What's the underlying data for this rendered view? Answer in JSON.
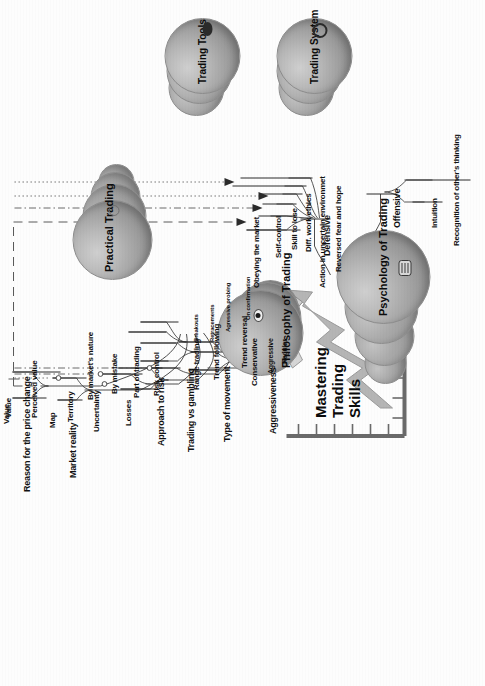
{
  "diagram": {
    "title": "Mastering Trading Skills",
    "title_lines": [
      "Mastering",
      "Trading",
      "Skills"
    ],
    "type": "mind-map",
    "orientation": "rotated-90-ccw",
    "colors": {
      "bubble_fill": "#a8a8a8",
      "bubble_shadow": "#7e7e7e",
      "line": "#2b2b2b",
      "text": "#111111",
      "background": "#ffffff",
      "arrow_fill": "#c9c9c9",
      "chart_axis": "#6f6f6f"
    }
  },
  "central_nodes": [
    {
      "id": "philosophy",
      "label": "Philosophy of Trading",
      "icon": "eye-icon"
    },
    {
      "id": "practical",
      "label": "Practical Trading",
      "icon": "disc-stack-icon"
    },
    {
      "id": "psychology",
      "label": "Psychology of Trading",
      "icon": "brain-icon"
    },
    {
      "id": "tools",
      "label": "Trading Tools",
      "icon": "wrench-icon"
    },
    {
      "id": "system",
      "label": "Trading System",
      "icon": "gear-icon"
    }
  ],
  "branches": {
    "philosophy": [
      {
        "label": "Reason for the price change",
        "children": [
          {
            "label": "Value"
          },
          {
            "label": "Perceived value"
          }
        ]
      },
      {
        "label": "Market reality",
        "children": [
          {
            "label": "Map"
          },
          {
            "label": "Territory",
            "marker": "circle"
          }
        ]
      },
      {
        "label": "Uncertainty",
        "marker": "circle",
        "children": [
          {
            "label": "By market's nature",
            "marker": "circle"
          }
        ]
      },
      {
        "label": "Losses",
        "children": [
          {
            "label": "By mistake"
          },
          {
            "label": "Part of trading"
          }
        ]
      },
      {
        "label": "Approach to risk",
        "children": [
          {
            "label": "Risk control",
            "marker": "circle"
          }
        ]
      },
      {
        "label": "Trading vs gambling",
        "children": []
      },
      {
        "label": "Type of movement",
        "children": [
          {
            "label": "Range trading"
          },
          {
            "label": "Trend following",
            "children": [
              {
                "label": "Breakouts"
              },
              {
                "label": "Retracements"
              }
            ]
          },
          {
            "label": "Trend reversal",
            "children": [
              {
                "label": "Agressive probing"
              },
              {
                "label": "On confirmation"
              }
            ]
          }
        ]
      },
      {
        "label": "Aggressiveness",
        "children": [
          {
            "label": "Conservative"
          },
          {
            "label": "Aggressive"
          },
          {
            "label": "Regular"
          }
        ]
      }
    ],
    "psychology": [
      {
        "label": "Defensive",
        "children": [
          {
            "label": "Obeying the market"
          },
          {
            "label": "Self-control"
          },
          {
            "label": "Skill to lose"
          },
          {
            "label": "Diff. work ethics"
          },
          {
            "label": "Action in uncertain environmet"
          },
          {
            "label": "Reversed fear and hope"
          }
        ]
      },
      {
        "label": "Offensive",
        "children": [
          {
            "label": "Intuition"
          },
          {
            "label": "Recognition of other's thinking"
          }
        ]
      }
    ]
  },
  "connector_lines": [
    {
      "style": "dashed",
      "target": "Obeying the market"
    },
    {
      "style": "dash-dot",
      "target": "Self-control"
    },
    {
      "style": "dotted",
      "target": "Skill to lose"
    },
    {
      "style": "dash-dot-2",
      "target": "Action in uncertain environmet"
    }
  ]
}
